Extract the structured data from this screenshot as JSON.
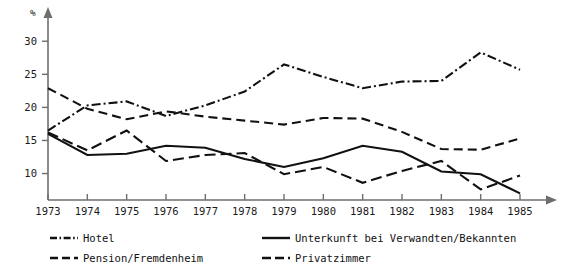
{
  "chart_data": {
    "type": "line",
    "title": "",
    "xlabel": "",
    "ylabel": "%",
    "ylim": [
      6,
      32
    ],
    "xlim": [
      1973,
      1985
    ],
    "grid": false,
    "legend_position": "bottom",
    "yticks": [
      10,
      15,
      20,
      25,
      30
    ],
    "ytick_labels": [
      "10",
      "15",
      "20",
      "25",
      "30"
    ],
    "categories": [
      1973,
      1974,
      1975,
      1976,
      1977,
      1978,
      1979,
      1980,
      1981,
      1982,
      1983,
      1984,
      1985
    ],
    "xtick_labels": [
      "1973",
      "1974",
      "1975",
      "1976",
      "1977",
      "1978",
      "1979",
      "1980",
      "1981",
      "1982",
      "1983",
      "1984",
      "1985"
    ],
    "series": [
      {
        "name": "Hotel",
        "dash": "dash-dot",
        "dasharray": "9,3,2,3",
        "values": [
          16.5,
          20.3,
          20.9,
          18.7,
          20.3,
          22.4,
          26.5,
          24.6,
          22.9,
          23.9,
          24.0,
          28.3,
          25.7
        ]
      },
      {
        "name": "Unterkunft bei Verwandten/Bekannten",
        "dash": "solid",
        "dasharray": "none",
        "values": [
          16.0,
          12.8,
          13.0,
          14.2,
          13.9,
          12.2,
          11.0,
          12.3,
          14.2,
          13.3,
          10.3,
          9.9,
          7.0
        ]
      },
      {
        "name": "Pension/Fremdenheim",
        "dash": "dash",
        "dasharray": "9,5",
        "values": [
          22.9,
          19.8,
          18.2,
          19.4,
          18.6,
          18.0,
          17.4,
          18.4,
          18.3,
          16.3,
          13.7,
          13.6,
          15.3
        ]
      },
      {
        "name": "Privatzimmer",
        "dash": "dash-long",
        "dasharray": "11,5",
        "values": [
          16.2,
          13.5,
          16.5,
          11.9,
          12.8,
          13.1,
          9.9,
          11.0,
          8.6,
          10.4,
          11.9,
          7.6,
          9.7
        ]
      }
    ]
  },
  "legend": {
    "entries": [
      {
        "label": "Hotel",
        "style": "dash-dot",
        "dasharray": "7,2.5,1.6,2.5"
      },
      {
        "label": "Unterkunft bei Verwandten/Bekannten",
        "style": "solid",
        "dasharray": "none"
      },
      {
        "label": "Pension/Fremdenheim",
        "style": "dash",
        "dasharray": "8,4"
      },
      {
        "label": "Privatzimmer",
        "style": "dash-long",
        "dasharray": "9,4"
      }
    ]
  },
  "colors": {
    "line": "#111111",
    "axis": "#6e6e6e",
    "text": "#1a1a1a",
    "background": "#ffffff"
  }
}
